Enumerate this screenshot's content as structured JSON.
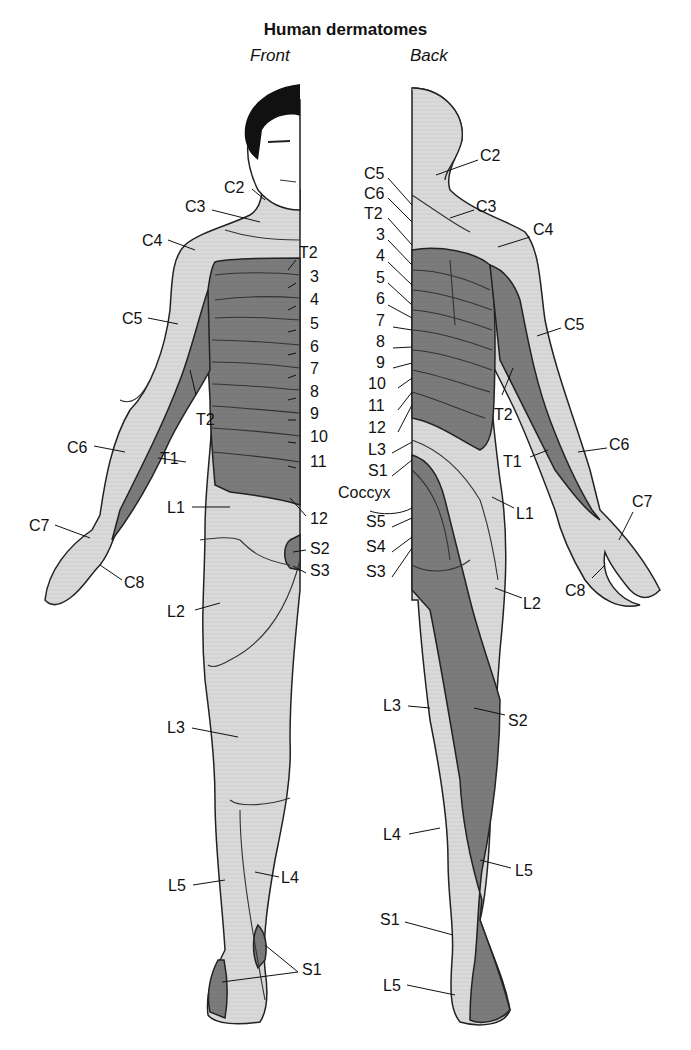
{
  "title": "Human dermatomes",
  "views": {
    "front": "Front",
    "back": "Back"
  },
  "colors": {
    "dark_region": "#7a7a7a",
    "light_region": "#d9d9d9",
    "outline": "#222222",
    "hair": "#111111"
  },
  "front_labels": [
    {
      "id": "C2",
      "text": "C2",
      "x": 224,
      "y": 180
    },
    {
      "id": "C3",
      "text": "C3",
      "x": 185,
      "y": 199
    },
    {
      "id": "C4",
      "text": "C4",
      "x": 142,
      "y": 233
    },
    {
      "id": "C5",
      "text": "C5",
      "x": 122,
      "y": 311
    },
    {
      "id": "T2a",
      "text": "T2",
      "x": 196,
      "y": 412
    },
    {
      "id": "C6",
      "text": "C6",
      "x": 67,
      "y": 440
    },
    {
      "id": "T1",
      "text": "T1",
      "x": 160,
      "y": 451
    },
    {
      "id": "L1",
      "text": "L1",
      "x": 167,
      "y": 500
    },
    {
      "id": "C7",
      "text": "C7",
      "x": 29,
      "y": 518
    },
    {
      "id": "C8",
      "text": "C8",
      "x": 124,
      "y": 575
    },
    {
      "id": "L2",
      "text": "L2",
      "x": 167,
      "y": 604
    },
    {
      "id": "L3",
      "text": "L3",
      "x": 167,
      "y": 720
    },
    {
      "id": "L5",
      "text": "L5",
      "x": 168,
      "y": 878
    },
    {
      "id": "L4",
      "text": "L4",
      "x": 281,
      "y": 870
    },
    {
      "id": "S1",
      "text": "S1",
      "x": 302,
      "y": 968
    }
  ],
  "front_trunk_labels": [
    {
      "id": "T2",
      "text": "T2",
      "y": 252
    },
    {
      "id": "T3",
      "text": "3",
      "y": 276
    },
    {
      "id": "T4",
      "text": "4",
      "y": 299
    },
    {
      "id": "T5",
      "text": "5",
      "y": 323
    },
    {
      "id": "T6",
      "text": "6",
      "y": 346
    },
    {
      "id": "T7",
      "text": "7",
      "y": 368
    },
    {
      "id": "T8",
      "text": "8",
      "y": 391
    },
    {
      "id": "T9",
      "text": "9",
      "y": 413
    },
    {
      "id": "T10",
      "text": "10",
      "y": 436
    },
    {
      "id": "T11",
      "text": "11",
      "y": 461
    },
    {
      "id": "T12",
      "text": "12",
      "y": 511
    },
    {
      "id": "S2",
      "text": "S2",
      "y": 545
    },
    {
      "id": "S3",
      "text": "S3",
      "y": 568
    }
  ],
  "back_spine_labels": [
    {
      "id": "C5",
      "text": "C5",
      "y": 173
    },
    {
      "id": "C6",
      "text": "C6",
      "y": 193
    },
    {
      "id": "T2",
      "text": "T2",
      "y": 213
    },
    {
      "id": "T3",
      "text": "3",
      "y": 234
    },
    {
      "id": "T4",
      "text": "4",
      "y": 255
    },
    {
      "id": "T5",
      "text": "5",
      "y": 277
    },
    {
      "id": "T6",
      "text": "6",
      "y": 298
    },
    {
      "id": "T7",
      "text": "7",
      "y": 320
    },
    {
      "id": "T8",
      "text": "8",
      "y": 341
    },
    {
      "id": "T9",
      "text": "9",
      "y": 362
    },
    {
      "id": "T10",
      "text": "10",
      "y": 383
    },
    {
      "id": "T11",
      "text": "11",
      "y": 405
    },
    {
      "id": "T12",
      "text": "12",
      "y": 427
    },
    {
      "id": "L3",
      "text": "L3",
      "y": 449
    },
    {
      "id": "S1",
      "text": "S1",
      "y": 470
    },
    {
      "id": "Coccyx",
      "text": "Coccyx",
      "y": 492
    },
    {
      "id": "S5",
      "text": "S5",
      "y": 520
    },
    {
      "id": "S4",
      "text": "S4",
      "y": 545
    },
    {
      "id": "S3",
      "text": "S3",
      "y": 570
    }
  ],
  "back_labels": [
    {
      "id": "C2",
      "text": "C2",
      "x": 480,
      "y": 148
    },
    {
      "id": "C3",
      "text": "C3",
      "x": 476,
      "y": 199
    },
    {
      "id": "C4",
      "text": "C4",
      "x": 533,
      "y": 222
    },
    {
      "id": "C5",
      "text": "C5",
      "x": 564,
      "y": 317
    },
    {
      "id": "T2",
      "text": "T2",
      "x": 494,
      "y": 412
    },
    {
      "id": "C6",
      "text": "C6",
      "x": 609,
      "y": 437
    },
    {
      "id": "T1",
      "text": "T1",
      "x": 503,
      "y": 454
    },
    {
      "id": "L1",
      "text": "L1",
      "x": 516,
      "y": 506
    },
    {
      "id": "C7",
      "text": "C7",
      "x": 632,
      "y": 494
    },
    {
      "id": "C8",
      "text": "C8",
      "x": 565,
      "y": 583
    },
    {
      "id": "L2",
      "text": "L2",
      "x": 523,
      "y": 596
    },
    {
      "id": "L3",
      "text": "L3",
      "x": 383,
      "y": 698
    },
    {
      "id": "S2",
      "text": "S2",
      "x": 508,
      "y": 713
    },
    {
      "id": "L4",
      "text": "L4",
      "x": 383,
      "y": 827
    },
    {
      "id": "L5a",
      "text": "L5",
      "x": 515,
      "y": 863
    },
    {
      "id": "S1",
      "text": "S1",
      "x": 380,
      "y": 912
    },
    {
      "id": "L5b",
      "text": "L5",
      "x": 383,
      "y": 978
    }
  ]
}
